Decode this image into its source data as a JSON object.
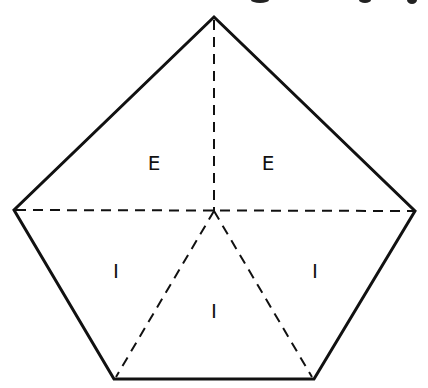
{
  "diagram": {
    "type": "pentagon-partition",
    "colors": {
      "stroke": "#111111",
      "background": "#ffffff"
    },
    "vertices": {
      "top": [
        214,
        17
      ],
      "left": [
        14,
        210
      ],
      "right": [
        415,
        211
      ],
      "bottom_left": [
        114,
        379
      ],
      "bottom_right": [
        314,
        379
      ],
      "center": [
        214,
        211
      ]
    },
    "labels": [
      {
        "text": "E",
        "x": 154,
        "y": 170
      },
      {
        "text": "E",
        "x": 268,
        "y": 170
      },
      {
        "text": "I",
        "x": 116,
        "y": 278
      },
      {
        "text": "I",
        "x": 315,
        "y": 278
      },
      {
        "text": "I",
        "x": 214,
        "y": 318
      }
    ]
  }
}
